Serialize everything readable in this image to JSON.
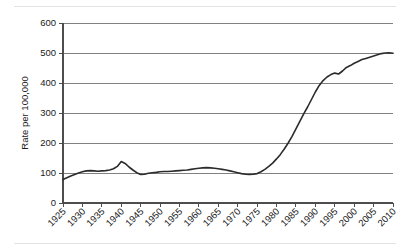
{
  "chart_data": {
    "type": "line",
    "title": "",
    "xlabel": "",
    "ylabel": "Rate per 100,000",
    "xlim": [
      1925,
      2010
    ],
    "ylim": [
      0,
      600
    ],
    "grid": true,
    "legend": false,
    "ytick_labels": [
      "0",
      "100",
      "200",
      "300",
      "400",
      "500",
      "600"
    ],
    "ytick_values": [
      0,
      100,
      200,
      300,
      400,
      500,
      600
    ],
    "xtick_labels": [
      "1925",
      "1930",
      "1935",
      "1940",
      "1945",
      "1950",
      "1955",
      "1960",
      "1965",
      "1970",
      "1975",
      "1980",
      "1985",
      "1990",
      "1995",
      "2000",
      "2005",
      "2010"
    ],
    "xtick_values": [
      1925,
      1930,
      1935,
      1940,
      1945,
      1950,
      1955,
      1960,
      1965,
      1970,
      1975,
      1980,
      1985,
      1990,
      1995,
      2000,
      2005,
      2010
    ],
    "series": [
      {
        "name": "Rate per 100,000",
        "color": "#2b2b2b",
        "x": [
          1925,
          1926,
          1927,
          1928,
          1929,
          1930,
          1931,
          1932,
          1933,
          1934,
          1935,
          1936,
          1937,
          1938,
          1939,
          1940,
          1941,
          1942,
          1943,
          1944,
          1945,
          1946,
          1947,
          1948,
          1949,
          1950,
          1951,
          1952,
          1953,
          1954,
          1955,
          1956,
          1957,
          1958,
          1959,
          1960,
          1961,
          1962,
          1963,
          1964,
          1965,
          1966,
          1967,
          1968,
          1969,
          1970,
          1971,
          1972,
          1973,
          1974,
          1975,
          1976,
          1977,
          1978,
          1979,
          1980,
          1981,
          1982,
          1983,
          1984,
          1985,
          1986,
          1987,
          1988,
          1989,
          1990,
          1991,
          1992,
          1993,
          1994,
          1995,
          1996,
          1997,
          1998,
          1999,
          2000,
          2001,
          2002,
          2003,
          2004,
          2005,
          2006,
          2007,
          2008,
          2009,
          2010
        ],
        "y": [
          78,
          84,
          90,
          95,
          100,
          104,
          107,
          108,
          107,
          106,
          107,
          108,
          110,
          114,
          122,
          138,
          132,
          120,
          110,
          101,
          95,
          96,
          99,
          101,
          102,
          104,
          105,
          105,
          106,
          107,
          108,
          109,
          110,
          112,
          114,
          116,
          117,
          118,
          117,
          116,
          114,
          112,
          110,
          107,
          104,
          101,
          98,
          96,
          95,
          96,
          98,
          104,
          112,
          122,
          133,
          147,
          162,
          180,
          200,
          222,
          247,
          272,
          297,
          320,
          345,
          370,
          392,
          408,
          420,
          428,
          433,
          430,
          440,
          452,
          458,
          466,
          472,
          478,
          482,
          486,
          490,
          494,
          498,
          500,
          501,
          499
        ]
      }
    ]
  }
}
